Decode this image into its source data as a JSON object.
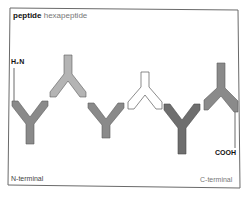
{
  "title": {
    "bold": "peptide",
    "sub": "hexapeptide"
  },
  "labels": {
    "n_group": "H₂N",
    "c_group": "COOH",
    "n_terminal": "N-terminal",
    "c_terminal": "C-terminal"
  },
  "residues": [
    {
      "index": 1,
      "orientation": "down",
      "fill": "#8a8a8a"
    },
    {
      "index": 2,
      "orientation": "up",
      "fill": "#b4b4b4"
    },
    {
      "index": 3,
      "orientation": "down",
      "fill": "#8a8a8a"
    },
    {
      "index": 4,
      "orientation": "up",
      "fill": "#ffffff"
    },
    {
      "index": 5,
      "orientation": "down",
      "fill": "#6e6e6e"
    },
    {
      "index": 6,
      "orientation": "up",
      "fill": "#8a8a8a"
    }
  ],
  "colors": {
    "frame": "#6a6a6a",
    "stroke": "#5a5a5a",
    "text": "#222222",
    "subtext": "#777777"
  }
}
